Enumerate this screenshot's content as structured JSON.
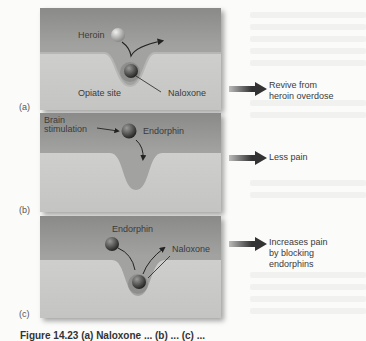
{
  "figure": {
    "panels": [
      {
        "tag": "(a)",
        "labels": {
          "molecule_top": "Heroin",
          "site": "Opiate site",
          "molecule_bound": "Naloxone"
        },
        "outcome": [
          "Revive from",
          "heroin overdose"
        ]
      },
      {
        "tag": "(b)",
        "labels": {
          "stimulus_line1": "Brain",
          "stimulus_line2": "stimulation",
          "molecule": "Endorphin"
        },
        "outcome": [
          "Less pain"
        ]
      },
      {
        "tag": "(c)",
        "labels": {
          "molecule_top": "Endorphin",
          "molecule_bound": "Naloxone"
        },
        "outcome": [
          "Increases pain",
          "by blocking",
          "endorphins"
        ]
      }
    ],
    "caption": "Figure 14.23 (a) Naloxone ... (b) ... (c) ...",
    "colors": {
      "membrane_top": "#8e8e8c",
      "membrane_bottom": "#cfcfcd",
      "molecule_dark": "#3a3a3a",
      "molecule_light": "#b8b8b6",
      "arrow": "#2e2e2e",
      "page_bg": "#fbfbfa"
    }
  }
}
